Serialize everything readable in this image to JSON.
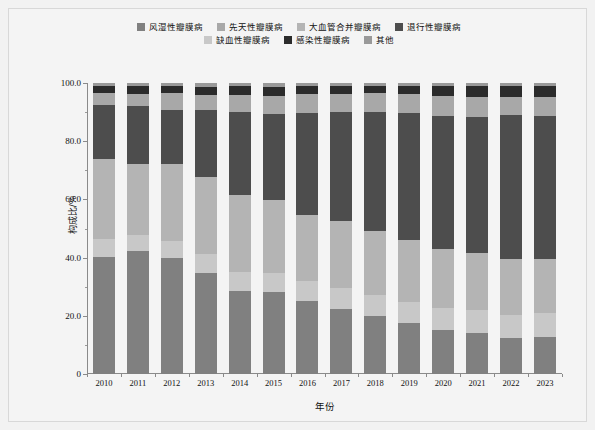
{
  "chart_data": {
    "type": "bar",
    "stacked": true,
    "normalized_percent": true,
    "title": "",
    "xlabel": "年份",
    "ylabel": "构成比/%",
    "ylim": [
      0,
      100
    ],
    "yticks": [
      0,
      20,
      40,
      60,
      80,
      100
    ],
    "ytick_labels": [
      "0",
      "20.0",
      "40.0",
      "60.0",
      "80.0",
      "100.0"
    ],
    "grid": false,
    "legend_position": "top",
    "categories": [
      "2010",
      "2011",
      "2012",
      "2013",
      "2014",
      "2015",
      "2016",
      "2017",
      "2018",
      "2019",
      "2020",
      "2021",
      "2022",
      "2023"
    ],
    "series": [
      {
        "name": "风湿性瓣膜病",
        "color": "#808080",
        "values": [
          40.2,
          42.3,
          40.0,
          34.8,
          28.6,
          28.2,
          25.1,
          22.4,
          19.8,
          17.5,
          15.0,
          14.2,
          12.4,
          12.6
        ]
      },
      {
        "name": "缺血性瓣膜病",
        "color": "#c8c8c8",
        "values": [
          6.2,
          5.6,
          5.8,
          6.3,
          6.6,
          6.4,
          6.8,
          7.0,
          7.2,
          7.4,
          7.6,
          7.8,
          8.0,
          8.2
        ]
      },
      {
        "name": "大血管合并瓣膜病",
        "color": "#b4b4b4",
        "values": [
          27.6,
          24.4,
          26.5,
          26.6,
          26.4,
          25.2,
          22.8,
          23.1,
          22.0,
          21.1,
          20.2,
          19.5,
          19.0,
          18.8
        ]
      },
      {
        "name": "退行性瓣膜病",
        "color": "#4d4d4d",
        "values": [
          18.5,
          19.8,
          18.6,
          23.0,
          28.3,
          29.6,
          35.1,
          37.6,
          41.2,
          43.8,
          46.0,
          47.0,
          49.5,
          48.9
        ]
      },
      {
        "name": "先天性瓣膜病",
        "color": "#a8a8a8",
        "values": [
          4.1,
          4.3,
          5.7,
          5.2,
          6.0,
          6.3,
          6.6,
          6.3,
          6.4,
          6.5,
          6.7,
          6.8,
          6.4,
          6.7
        ]
      },
      {
        "name": "感染性瓣膜病",
        "color": "#2b2b2b",
        "values": [
          2.4,
          2.6,
          2.4,
          2.9,
          3.0,
          3.1,
          2.6,
          2.6,
          2.4,
          2.6,
          3.4,
          3.6,
          3.6,
          3.7
        ]
      },
      {
        "name": "其他",
        "color": "#999999",
        "values": [
          1.0,
          1.0,
          1.0,
          1.2,
          1.1,
          1.2,
          1.0,
          1.0,
          1.0,
          1.1,
          1.1,
          1.1,
          1.1,
          1.1
        ]
      }
    ],
    "legend_order": [
      "风湿性瓣膜病",
      "先天性瓣膜病",
      "大血管合并瓣膜病",
      "退行性瓣膜病",
      "缺血性瓣膜病",
      "感染性瓣膜病",
      "其他"
    ]
  },
  "legend": {
    "row1": [
      {
        "label": "风湿性瓣膜病",
        "color": "#808080"
      },
      {
        "label": "先天性瓣膜病",
        "color": "#a8a8a8"
      },
      {
        "label": "大血管合并瓣膜病",
        "color": "#b4b4b4"
      },
      {
        "label": "退行性瓣膜病",
        "color": "#4d4d4d"
      }
    ],
    "row2": [
      {
        "label": "缺血性瓣膜病",
        "color": "#c8c8c8"
      },
      {
        "label": "感染性瓣膜病",
        "color": "#2b2b2b"
      },
      {
        "label": "其他",
        "color": "#999999"
      }
    ]
  },
  "axes": {
    "y_title": "构成比/%",
    "x_title": "年份",
    "y_tick_labels": [
      "100.0",
      "80.0",
      "60.0",
      "40.0",
      "20.0",
      "0"
    ],
    "x_tick_labels": [
      "2010",
      "2011",
      "2012",
      "2013",
      "2014",
      "2015",
      "2016",
      "2017",
      "2018",
      "2019",
      "2020",
      "2021",
      "2022",
      "2023"
    ]
  }
}
